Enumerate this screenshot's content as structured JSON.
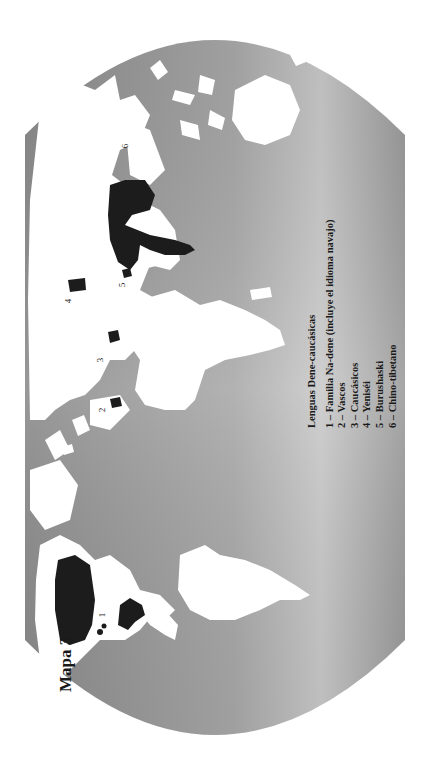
{
  "map": {
    "title": "Mapa 3",
    "orientation": "rotated 90° counterclockwise",
    "colors": {
      "ocean": "#8e8e8e",
      "ocean_light": "#d4d4d4",
      "land": "#ffffff",
      "highlight": "#1c1c1c",
      "background": "#ffffff"
    },
    "legend": {
      "title": "Lenguas Dene-caucásicas",
      "items": [
        {
          "num": "1",
          "label": "1 – Familia Na-dene (incluye el idioma navajo)"
        },
        {
          "num": "2",
          "label": "2 – Vascos"
        },
        {
          "num": "3",
          "label": "3 – Caucásicos"
        },
        {
          "num": "4",
          "label": "4 – Yeniséi"
        },
        {
          "num": "5",
          "label": "5 – Burushaski"
        },
        {
          "num": "6",
          "label": "6 – Chino-tibetano"
        }
      ]
    },
    "region_labels": [
      "1",
      "2",
      "3",
      "4",
      "5",
      "6"
    ]
  }
}
